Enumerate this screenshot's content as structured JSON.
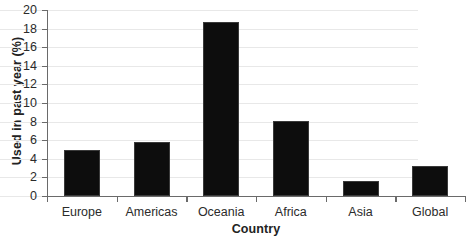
{
  "chart_data": {
    "type": "bar",
    "title": "",
    "categories": [
      "Europe",
      "Americas",
      "Oceania",
      "Africa",
      "Asia",
      "Global"
    ],
    "values": [
      4.9,
      5.8,
      18.7,
      8.1,
      1.6,
      3.2
    ],
    "xlabel": "Country",
    "ylabel": "Used in past year (%)",
    "ylim": [
      0,
      20
    ],
    "ytick_step": 2,
    "yticks": [
      "0",
      "2",
      "4",
      "6",
      "8",
      "10",
      "12",
      "14",
      "16",
      "18",
      "20"
    ],
    "grid": true,
    "legend": false,
    "bar_color": "#0d0d0d",
    "gridline_color": "#e8e8e8",
    "axis_color": "#6a6a6a",
    "background_color": "#ffffff"
  }
}
